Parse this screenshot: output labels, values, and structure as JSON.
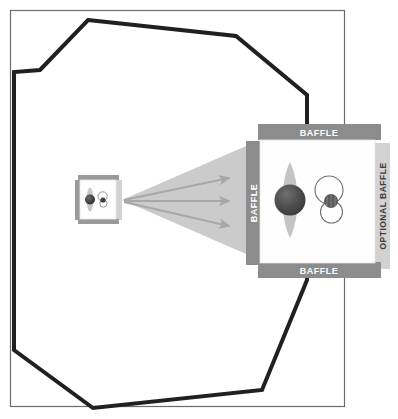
{
  "figure": {
    "name": "anechoic-chamber-measurement-setup",
    "background": "#ffffff",
    "frame": {
      "stroke": "#6b6b6b",
      "fill": "#ffffff",
      "x": 10,
      "y": 10,
      "width": 334,
      "height": 396
    }
  },
  "chamber": {
    "name": "anechoic-chamber-outline",
    "stroke": "#231f20",
    "stroke_width": 4,
    "fill": "none",
    "points": "88,20 236,36 307,95 307,280 262,390 93,408 14,350 14,72 40,70"
  },
  "colors": {
    "baffle_dark": "#8c8c8c",
    "baffle_light": "#d2d2d2",
    "baffle_text_on_dark": "#ffffff",
    "baffle_text_on_light": "#3d3d3d",
    "panel_white": "#fefefe",
    "panel_edge": "#e2e2e2",
    "cone_grey": "#cbcbcb",
    "arrow_grey": "#a8a8a8",
    "lobe_grey": "#c2c2c2",
    "sphere_dark": "#4a4a4a",
    "sphere_highlight": "#6d6d6d",
    "mic_outline": "#6f6f6f",
    "mic_body": "#5a5a5a"
  },
  "test_station": {
    "name": "device-under-test-station",
    "panel": {
      "x": 260,
      "y": 140,
      "width": 112,
      "height": 122
    },
    "baffles": [
      {
        "id": "baffle-top",
        "label": "BAFFLE",
        "orientation": "horizontal",
        "tone": "dark",
        "x": 258,
        "y": 124,
        "width": 122,
        "height": 16
      },
      {
        "id": "baffle-bottom",
        "label": "BAFFLE",
        "orientation": "horizontal",
        "tone": "dark",
        "x": 258,
        "y": 262,
        "width": 122,
        "height": 16
      },
      {
        "id": "baffle-left",
        "label": "BAFFLE",
        "orientation": "vertical",
        "tone": "dark",
        "x": 246,
        "y": 142,
        "width": 14,
        "height": 122
      },
      {
        "id": "baffle-optional-right",
        "label": "OPTIONAL BAFFLE",
        "orientation": "vertical",
        "tone": "light",
        "x": 376,
        "y": 144,
        "width": 14,
        "height": 124
      }
    ],
    "source": {
      "name": "loudspeaker-source-sphere",
      "cx": 290,
      "cy": 200,
      "r": 15,
      "lobe": {
        "name": "omnidirectional-radiation-lobe",
        "cx": 290,
        "cy": 200,
        "rx": 10,
        "ry": 38
      }
    },
    "microphone": {
      "name": "measurement-microphone",
      "cx": 331,
      "cy": 201,
      "body_r": 7,
      "pattern": "figure-eight",
      "lobes": [
        {
          "id": "mic-lobe-upper",
          "cx": 329,
          "cy": 189,
          "r": 14
        },
        {
          "id": "mic-lobe-lower",
          "cx": 331,
          "cy": 212,
          "r": 11
        }
      ]
    }
  },
  "reference_station": {
    "name": "reference-source-station-small",
    "panel": {
      "x": 80,
      "y": 180,
      "width": 36,
      "height": 38
    },
    "baffles": [
      {
        "id": "ref-baffle-top",
        "orientation": "horizontal",
        "tone": "dark",
        "x": 79,
        "y": 175,
        "width": 40,
        "height": 5
      },
      {
        "id": "ref-baffle-bottom",
        "orientation": "horizontal",
        "tone": "dark",
        "x": 79,
        "y": 218,
        "width": 40,
        "height": 5
      },
      {
        "id": "ref-baffle-left",
        "orientation": "vertical",
        "tone": "dark",
        "x": 75,
        "y": 180,
        "width": 5,
        "height": 38
      },
      {
        "id": "ref-baffle-optional-right",
        "orientation": "vertical",
        "tone": "light",
        "x": 117,
        "y": 181,
        "width": 5,
        "height": 38
      }
    ],
    "source": {
      "name": "reference-source-sphere",
      "cx": 90,
      "cy": 199,
      "r": 5
    },
    "lobe": {
      "name": "reference-radiation-lobe",
      "cx": 90,
      "cy": 199,
      "rx": 3,
      "ry": 12
    },
    "microphone": {
      "name": "reference-microphone",
      "cx": 103,
      "cy": 200,
      "body_r": 2.5
    }
  },
  "beam": {
    "name": "sound-propagation-cone",
    "fill": "#cbcbcb",
    "apex_x": 122,
    "apex_y": 200,
    "points": "122,200 246,146 246,254"
  },
  "rays": {
    "name": "sound-ray-arrows",
    "stroke": "#a8a8a8",
    "stroke_width": 2,
    "items": [
      {
        "id": "ray-upper",
        "x1": 124,
        "y1": 200,
        "x2": 234,
        "y2": 177
      },
      {
        "id": "ray-center",
        "x1": 124,
        "y1": 201,
        "x2": 234,
        "y2": 201
      },
      {
        "id": "ray-lower",
        "x1": 124,
        "y1": 202,
        "x2": 234,
        "y2": 227
      }
    ]
  }
}
